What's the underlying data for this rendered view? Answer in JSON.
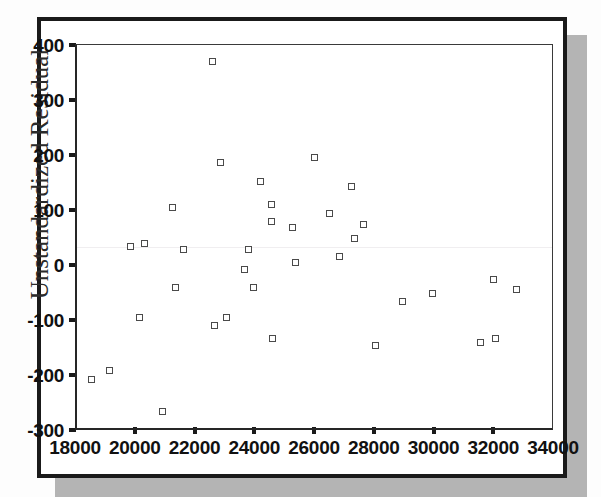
{
  "chart_data": {
    "type": "scatter",
    "title": "",
    "xlabel": "",
    "ylabel": "Unstandardized Residual",
    "xlim": [
      18000,
      34000
    ],
    "ylim": [
      -300,
      400
    ],
    "xticks": [
      18000,
      20000,
      22000,
      24000,
      26000,
      28000,
      30000,
      32000,
      34000
    ],
    "yticks": [
      400,
      300,
      200,
      100,
      0,
      -100,
      -200,
      -300
    ],
    "xtick_labels": [
      "18000",
      "20000",
      "22000",
      "24000",
      "26000",
      "28000",
      "30000",
      "32000",
      "34000"
    ],
    "ytick_labels": [
      "400",
      "300",
      "200",
      "100",
      "0",
      "-100",
      "-200",
      "-300"
    ],
    "grid": false,
    "legend": null,
    "marker": "open-square",
    "marker_color": "#4a4a4a",
    "points": [
      {
        "x": 18500,
        "y": -208
      },
      {
        "x": 19100,
        "y": -191
      },
      {
        "x": 19800,
        "y": 33
      },
      {
        "x": 20250,
        "y": 40
      },
      {
        "x": 20100,
        "y": -95
      },
      {
        "x": 20850,
        "y": -267
      },
      {
        "x": 21200,
        "y": 104
      },
      {
        "x": 21300,
        "y": -41
      },
      {
        "x": 21550,
        "y": 28
      },
      {
        "x": 22550,
        "y": 370
      },
      {
        "x": 22600,
        "y": -110
      },
      {
        "x": 22800,
        "y": 186
      },
      {
        "x": 23000,
        "y": -95
      },
      {
        "x": 23600,
        "y": -8
      },
      {
        "x": 23750,
        "y": 28
      },
      {
        "x": 23900,
        "y": -40
      },
      {
        "x": 24150,
        "y": 151
      },
      {
        "x": 24500,
        "y": 110
      },
      {
        "x": 24500,
        "y": 79
      },
      {
        "x": 24550,
        "y": -134
      },
      {
        "x": 25200,
        "y": 68
      },
      {
        "x": 25300,
        "y": 5
      },
      {
        "x": 25950,
        "y": 196
      },
      {
        "x": 26450,
        "y": 94
      },
      {
        "x": 26800,
        "y": 16
      },
      {
        "x": 27200,
        "y": 142
      },
      {
        "x": 27300,
        "y": 49
      },
      {
        "x": 27600,
        "y": 73
      },
      {
        "x": 28000,
        "y": -146
      },
      {
        "x": 28900,
        "y": -66
      },
      {
        "x": 29900,
        "y": -52
      },
      {
        "x": 31500,
        "y": -141
      },
      {
        "x": 31950,
        "y": -27
      },
      {
        "x": 32000,
        "y": -134
      },
      {
        "x": 32700,
        "y": -44
      }
    ]
  }
}
